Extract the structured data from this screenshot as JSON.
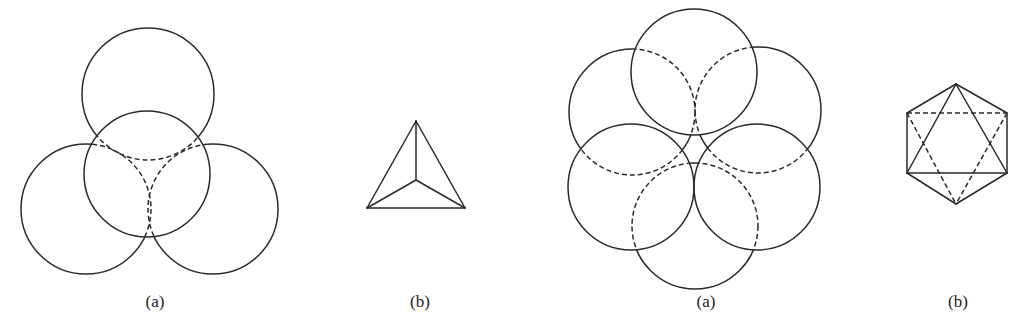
{
  "figures": [
    {
      "id": "fig1a",
      "label": "(a)",
      "label_pos": [
        155,
        292
      ],
      "description": "Three circles around a central circle; hidden arcs dashed",
      "front_circles": [
        {
          "cx": 147,
          "cy": 174,
          "r": 63
        }
      ],
      "back_circles": [
        {
          "cx": 148,
          "cy": 94,
          "r": 66
        },
        {
          "cx": 86,
          "cy": 209,
          "r": 65
        },
        {
          "cx": 213,
          "cy": 209,
          "r": 65
        }
      ]
    },
    {
      "id": "fig1b",
      "label": "(b)",
      "label_pos": [
        420,
        292
      ],
      "description": "Tetrahedron viewed from above",
      "solid_lines": [
        [
          [
            416,
            121
          ],
          [
            367,
            208
          ]
        ],
        [
          [
            416,
            121
          ],
          [
            465,
            208
          ]
        ],
        [
          [
            367,
            208
          ],
          [
            465,
            208
          ]
        ],
        [
          [
            416,
            121
          ],
          [
            416,
            180
          ]
        ],
        [
          [
            416,
            180
          ],
          [
            367,
            208
          ]
        ],
        [
          [
            416,
            180
          ],
          [
            465,
            208
          ]
        ]
      ],
      "dashed_lines": []
    },
    {
      "id": "fig2a",
      "label": "(a)",
      "label_pos": [
        706,
        292
      ],
      "description": "Six circles in hexagonal arrangement; hidden arcs dashed",
      "front_circles": [
        {
          "cx": 694,
          "cy": 72,
          "r": 63
        },
        {
          "cx": 631,
          "cy": 187,
          "r": 63
        },
        {
          "cx": 757,
          "cy": 187,
          "r": 63
        }
      ],
      "back_circles": [
        {
          "cx": 632,
          "cy": 112,
          "r": 63
        },
        {
          "cx": 758,
          "cy": 110,
          "r": 63
        },
        {
          "cx": 695,
          "cy": 226,
          "r": 63
        }
      ]
    },
    {
      "id": "fig2b",
      "label": "(b)",
      "label_pos": [
        958,
        292
      ],
      "description": "Octahedron outline inside hexagon",
      "solid_lines": [
        [
          [
            956,
            84
          ],
          [
            907,
            113
          ]
        ],
        [
          [
            956,
            84
          ],
          [
            1007,
            113
          ]
        ],
        [
          [
            907,
            113
          ],
          [
            907,
            173
          ]
        ],
        [
          [
            1007,
            113
          ],
          [
            1007,
            173
          ]
        ],
        [
          [
            907,
            173
          ],
          [
            956,
            204
          ]
        ],
        [
          [
            1007,
            173
          ],
          [
            956,
            204
          ]
        ],
        [
          [
            956,
            84
          ],
          [
            907,
            173
          ]
        ],
        [
          [
            956,
            84
          ],
          [
            1007,
            173
          ]
        ],
        [
          [
            907,
            173
          ],
          [
            1007,
            173
          ]
        ]
      ],
      "dashed_lines": [
        [
          [
            907,
            113
          ],
          [
            1007,
            113
          ]
        ],
        [
          [
            907,
            113
          ],
          [
            956,
            204
          ]
        ],
        [
          [
            1007,
            113
          ],
          [
            956,
            204
          ]
        ]
      ]
    }
  ]
}
